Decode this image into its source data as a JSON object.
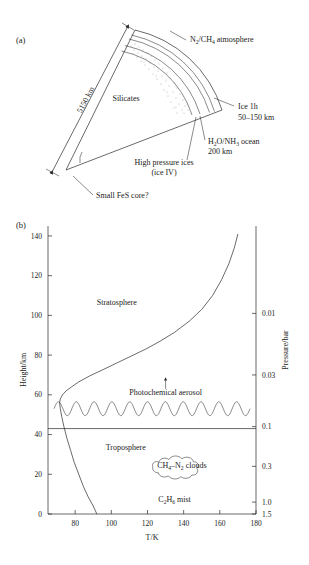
{
  "figure": {
    "panel_a": {
      "tag": "(a)",
      "labels": {
        "diameter": "5150 km",
        "atmosphere": "N2/CH4 atmosphere",
        "atmosphere_parts": [
          "N",
          "2",
          "/CH",
          "4",
          " atmosphere"
        ],
        "ice": "Ice 1h",
        "ice_thickness": "50–150 km",
        "ocean": "H2O/NH3 ocean",
        "ocean_parts": [
          "H",
          "2",
          "O/NH",
          "3",
          " ocean"
        ],
        "ocean_thickness": "200 km",
        "high_pressure_ices": "High pressure ices",
        "high_pressure_ices_sub": "(ice IV)",
        "silicates": "Silicates",
        "core": "Small FeS core?"
      }
    },
    "panel_b": {
      "tag": "(b)",
      "labels": {
        "stratosphere": "Stratosphere",
        "troposphere": "Troposphere",
        "photochemical_aerosol": "Photochemical aerosol",
        "clouds": "CH4–N2 clouds",
        "clouds_parts": [
          "CH",
          "4",
          "–N",
          "2",
          " clouds"
        ],
        "mist": "C2H6 mist",
        "mist_parts": [
          "C",
          "2",
          "H",
          "6",
          " mist"
        ]
      }
    },
    "caption": "",
    "colors": {
      "ink": "#2a2a2a",
      "text": "#1a1a1a",
      "paper": "#ffffff"
    }
  },
  "chart_data": {
    "type": "line",
    "title": "",
    "xlabel": "T/K",
    "ylabel": "Height/km",
    "y2label": "Pressure/bar",
    "xlim": [
      65,
      180
    ],
    "ylim": [
      0,
      145
    ],
    "grid": false,
    "legend": "none",
    "xticks": [
      80,
      100,
      120,
      140,
      160,
      180
    ],
    "yticks": [
      0,
      20,
      40,
      60,
      80,
      100,
      120,
      140
    ],
    "y2ticks": [
      {
        "value": 0.01,
        "label": "0.01",
        "height_km": 101
      },
      {
        "value": 0.03,
        "label": "0.03",
        "height_km": 70
      },
      {
        "value": 0.1,
        "label": "0.1",
        "height_km": 44
      },
      {
        "value": 0.3,
        "label": "0.3",
        "height_km": 24
      },
      {
        "value": 1.0,
        "label": "1.0",
        "height_km": 6
      },
      {
        "value": 1.5,
        "label": "1.5",
        "height_km": 0
      }
    ],
    "series": [
      {
        "name": "Temperature profile",
        "points": [
          [
            92,
            0
          ],
          [
            90,
            4
          ],
          [
            87,
            9
          ],
          [
            84.5,
            14
          ],
          [
            82,
            20
          ],
          [
            79.5,
            26
          ],
          [
            77.5,
            32
          ],
          [
            75.5,
            38
          ],
          [
            73.8,
            44
          ],
          [
            72.6,
            49
          ],
          [
            71.8,
            53
          ],
          [
            71.4,
            56
          ],
          [
            71.8,
            58
          ],
          [
            73,
            60
          ],
          [
            75,
            62
          ],
          [
            78,
            64
          ],
          [
            82,
            66.5
          ],
          [
            88,
            69.5
          ],
          [
            95,
            72.5
          ],
          [
            103,
            76
          ],
          [
            111,
            79.5
          ],
          [
            119,
            83
          ],
          [
            127,
            87
          ],
          [
            135,
            91.5
          ],
          [
            143,
            97
          ],
          [
            150,
            103
          ],
          [
            156,
            110
          ],
          [
            161,
            118
          ],
          [
            165,
            126
          ],
          [
            168,
            134
          ],
          [
            170,
            141
          ]
        ]
      }
    ],
    "annotations": [
      {
        "text": "Stratosphere",
        "x": 103,
        "y": 105
      },
      {
        "text": "Troposphere",
        "x": 108,
        "y": 32
      },
      {
        "text": "Photochemical aerosol",
        "x": 130,
        "y": 60,
        "arrow_to_y": 68
      },
      {
        "text": "CH4–N2 clouds",
        "x": 139,
        "y": 23
      },
      {
        "text": "C2H6 mist",
        "x": 135,
        "y": 6
      },
      {
        "text": "tropopause_line",
        "x": null,
        "y": 43
      }
    ],
    "aerosol_layer": {
      "center_height_km": 53,
      "amplitude_km": 3.5,
      "cycles": 11
    },
    "tropopause_height_km": 43
  }
}
